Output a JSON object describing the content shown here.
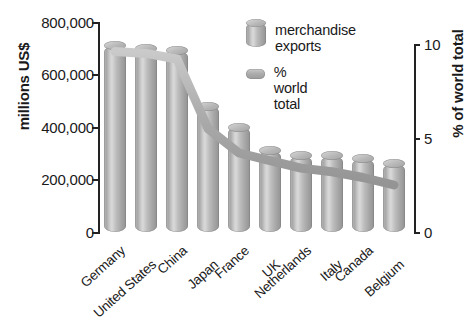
{
  "chart_data": {
    "type": "bar",
    "title": "",
    "subtitle": "",
    "categories": [
      "Germany",
      "United States",
      "China",
      "Japan",
      "France",
      "UK",
      "Netherlands",
      "Italy",
      "Canada",
      "Belgium"
    ],
    "series": [
      {
        "name": "merchandise exports",
        "axis": "left",
        "unit": "millions US$",
        "values": [
          710000,
          700000,
          690000,
          480000,
          400000,
          310000,
          290000,
          290000,
          280000,
          260000
        ]
      },
      {
        "name": "% world total",
        "axis": "right",
        "unit": "%",
        "values": [
          9.6,
          9.5,
          9.2,
          5.5,
          4.2,
          3.8,
          3.4,
          3.2,
          2.9,
          2.5
        ]
      }
    ],
    "ylabel": "millions US$",
    "ylabel_right": "% of world total",
    "xlabel": "",
    "ylim": [
      0,
      800000
    ],
    "ylim_right": [
      0,
      10
    ],
    "yticks": [
      "0",
      "200,000",
      "400,000",
      "600,000",
      "800,000"
    ],
    "yticks_right": [
      "0",
      "5",
      "10"
    ],
    "grid": false,
    "legend_position": "top-right"
  },
  "axes": {
    "left": {
      "label": "millions US$",
      "ticks": [
        {
          "value": 800000,
          "text": "800,000"
        },
        {
          "value": 600000,
          "text": "600,000"
        },
        {
          "value": 400000,
          "text": "400,000"
        },
        {
          "value": 200000,
          "text": "200,000"
        },
        {
          "value": 0,
          "text": "0"
        }
      ]
    },
    "right": {
      "label": "% of world total",
      "ticks": [
        {
          "value": 10,
          "text": "10"
        },
        {
          "value": 5,
          "text": "5"
        },
        {
          "value": 0,
          "text": "0"
        }
      ]
    }
  },
  "legend": {
    "items": [
      {
        "label": "merchandise\nexports",
        "icon": "cylinder-icon",
        "color": "#b0b0b0"
      },
      {
        "label": "% world total",
        "icon": "line-swatch-icon",
        "color": "#ababab"
      }
    ]
  },
  "colors": {
    "bar": "#b0b0b0",
    "line": "#a8a8a8",
    "axis": "#222222",
    "text": "#1a1a1a",
    "background": "#ffffff"
  }
}
